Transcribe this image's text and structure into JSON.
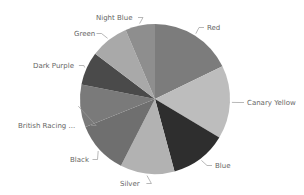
{
  "chart_data": {
    "type": "pie",
    "title": "",
    "legend": "none (data labels with leader lines)",
    "start_angle_deg": 0,
    "direction": "clockwise",
    "categories": [
      "Red",
      "Canary Yellow",
      "Blue",
      "Silver",
      "Black",
      "British Racing ...",
      "Dark Purple",
      "Green",
      "Night Blue"
    ],
    "values": [
      17.8,
      15.8,
      12.2,
      11.7,
      11.4,
      9.2,
      7.2,
      8.3,
      6.4
    ],
    "colors": [
      "#7c7c7c",
      "#bdbdbd",
      "#2e2e2e",
      "#b2b2b2",
      "#6f6f6f",
      "#7a7a7a",
      "#4a4a4a",
      "#a9a9a9",
      "#8e8e8e"
    ],
    "units": "percent (estimated from slice angles)"
  },
  "labels": [
    {
      "text": "Red",
      "x": 207,
      "y": 30,
      "anchor": "start"
    },
    {
      "text": "Canary Yellow",
      "x": 247,
      "y": 105,
      "anchor": "start"
    },
    {
      "text": "Blue",
      "x": 215,
      "y": 168,
      "anchor": "start"
    },
    {
      "text": "Silver",
      "x": 120,
      "y": 186,
      "anchor": "start"
    },
    {
      "text": "Black",
      "x": 70,
      "y": 162,
      "anchor": "start"
    },
    {
      "text": "British Racing ...",
      "x": 18,
      "y": 128,
      "anchor": "start"
    },
    {
      "text": "Dark Purple",
      "x": 33,
      "y": 68,
      "anchor": "start"
    },
    {
      "text": "Green",
      "x": 74,
      "y": 36,
      "anchor": "start"
    },
    {
      "text": "Night Blue",
      "x": 96,
      "y": 20,
      "anchor": "start"
    }
  ]
}
